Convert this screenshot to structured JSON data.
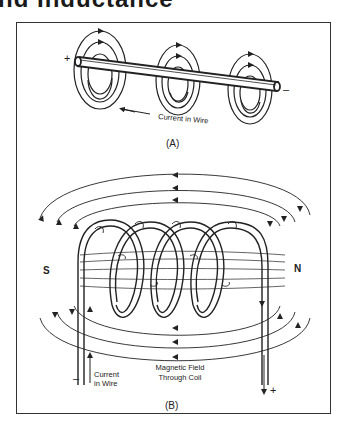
{
  "page": {
    "heading_partial": "nd Inductance"
  },
  "panel_a": {
    "caption": "(A)",
    "plus_label": "+",
    "minus_label": "–",
    "current_label": "Current in Wire"
  },
  "panel_b": {
    "caption": "(B)",
    "south_label": "S",
    "north_label": "N",
    "minus_label": "–",
    "plus_label": "+",
    "current_label_line1": "Current",
    "current_label_line2": "in Wire",
    "field_label_line1": "Magnetic Field",
    "field_label_line2": "Through Coil"
  },
  "colors": {
    "line": "#222222",
    "frame": "#333333",
    "background": "#ffffff"
  }
}
